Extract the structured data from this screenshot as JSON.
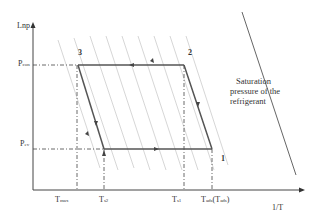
{
  "axes": {
    "y_label": "Lnp",
    "x_label": "1/T"
  },
  "pressure_levels": {
    "p_con": {
      "main": "P",
      "sub": "con"
    },
    "p_ev": {
      "main": "P",
      "sub": "ev"
    }
  },
  "temperature_ticks": {
    "t_max": {
      "main": "T",
      "sub": "max"
    },
    "t_s2": {
      "main": "T",
      "sub": "s2"
    },
    "t_s1": {
      "main": "T",
      "sub": "s1"
    },
    "t_ads": {
      "main": "T",
      "sub": "ads",
      "paren_main": "T",
      "paren_sub": "ads"
    }
  },
  "points": {
    "p1": "1",
    "p2": "2",
    "p3": "3"
  },
  "annotation": {
    "line1": "Saturation",
    "line2": "pressure of the",
    "line3": "refrigerant"
  },
  "colors": {
    "axis": "#444444",
    "cycle": "#555555",
    "isostere": "#bbbbbb",
    "saturation": "#666666",
    "text": "#333333"
  }
}
